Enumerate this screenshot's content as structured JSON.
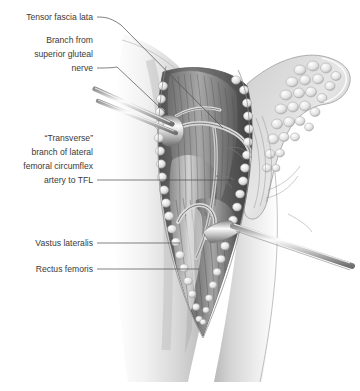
{
  "figure": {
    "type": "medical-illustration",
    "style": "grayscale pen-and-ink / airbrush anatomical drawing",
    "background_color": "#ffffff",
    "label_color": "#3a3a3a",
    "leader_color": "#4a4a4a"
  },
  "labels": [
    {
      "id": "tensor-fascia-lata",
      "lines": [
        "Tensor fascia lata"
      ],
      "align": "right",
      "text_x": 93,
      "text_y": 20,
      "leader": "M97,17 C108,17 112,19 121,25"
    },
    {
      "id": "branch-superior-gluteal-nerve",
      "lines": [
        "Branch from",
        "superior gluteal",
        "nerve"
      ],
      "align": "right",
      "text_x": 93,
      "text_y": 43,
      "leader": "M97,71 C106,71 110,70 117,68"
    },
    {
      "id": "transverse-branch-lfca",
      "lines": [
        "“Transverse”",
        "branch of lateral",
        "femoral circumflex",
        "artery to TFL"
      ],
      "align": "right",
      "text_x": 93,
      "text_y": 141,
      "leader": "M97,180 L232,180"
    },
    {
      "id": "vastus-lateralis",
      "lines": [
        "Vastus lateralis"
      ],
      "align": "right",
      "text_x": 93,
      "text_y": 245,
      "leader": "M97,243 L178,243"
    },
    {
      "id": "rectus-femoris",
      "lines": [
        "Rectus femoris"
      ],
      "align": "right",
      "text_x": 93,
      "text_y": 271,
      "leader": "M97,269 L197,269"
    }
  ],
  "anatomy": {
    "structures": [
      "thigh skin surface",
      "longitudinal surgical incision",
      "subcutaneous fat lobules along wound edges",
      "retracted skin and fascia flap",
      "tensor fascia lata muscle",
      "vastus lateralis muscle",
      "rectus femoris muscle",
      "transverse branch of lateral femoral circumflex artery",
      "branch from superior gluteal nerve"
    ],
    "instruments": [
      "two thin retractor rods entering from upper left",
      "metal ribbon retractor entering from lower right"
    ]
  }
}
